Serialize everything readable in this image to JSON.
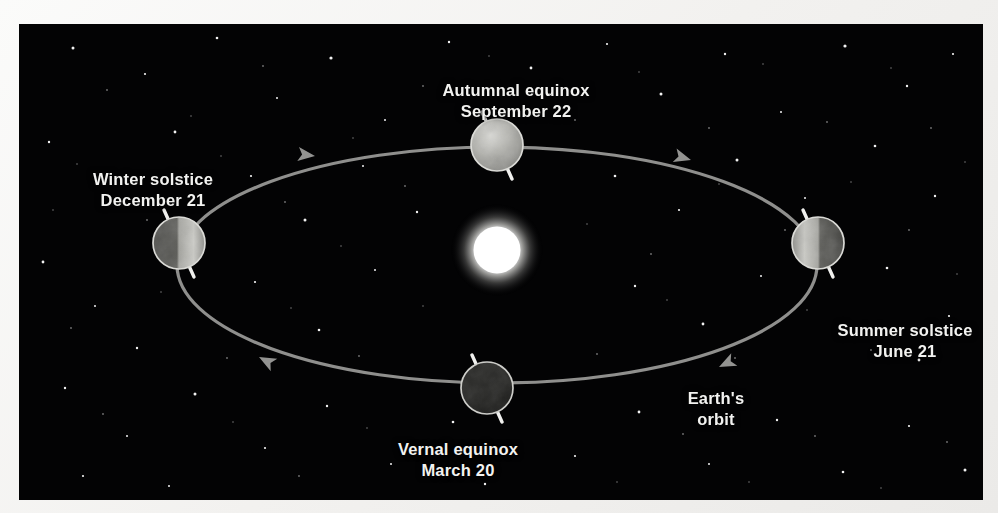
{
  "diagram": {
    "background_color": "#030304",
    "margin_color": "#f2f1ef",
    "label_color": "#f2f2f0",
    "orbit_color": "#9b9b99",
    "sun_color": "#ffffff"
  },
  "sun": {
    "name": "Sun",
    "cx": 478,
    "cy": 226,
    "radius": 24,
    "glow_radius": 46
  },
  "orbit": {
    "label_line1": "Earth's",
    "label_line2": "orbit",
    "cx": 478,
    "cy": 241,
    "rx": 320,
    "ry": 118,
    "direction": "counterclockwise",
    "arrow_count": 4
  },
  "positions": [
    {
      "id": "autumnal-equinox",
      "line1": "Autumnal equinox",
      "line2": "September 22",
      "cx": 478,
      "cy": 121,
      "radius": 26,
      "lit_side": "full-front",
      "brightness": "bright"
    },
    {
      "id": "winter-solstice",
      "line1": "Winter solstice",
      "line2": "December 21",
      "cx": 160,
      "cy": 219,
      "radius": 26,
      "lit_side": "right",
      "brightness": "half"
    },
    {
      "id": "summer-solstice",
      "line1": "Summer solstice",
      "line2": "June 21",
      "cx": 799,
      "cy": 219,
      "radius": 26,
      "lit_side": "left",
      "brightness": "half"
    },
    {
      "id": "vernal-equinox",
      "line1": "Vernal equinox",
      "line2": "March 20",
      "cx": 468,
      "cy": 364,
      "radius": 26,
      "lit_side": "none",
      "brightness": "dark"
    }
  ],
  "axis": {
    "tilt_degrees": 23.5,
    "description": "Earth rotation axis drawn tilted, same absolute direction at all four positions"
  }
}
